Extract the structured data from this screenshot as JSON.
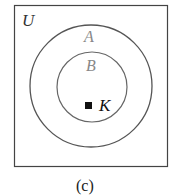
{
  "diagram": {
    "type": "venn",
    "universe_label": "U",
    "sets": [
      {
        "label": "A",
        "contains": [
          "B"
        ]
      },
      {
        "label": "B",
        "contains": [
          "K"
        ]
      }
    ],
    "element": {
      "label": "K",
      "marker": "filled-square"
    },
    "caption": "(c)",
    "colors": {
      "outline": "#444444",
      "labels_set": "#777777",
      "labels_dark": "#111111"
    }
  }
}
